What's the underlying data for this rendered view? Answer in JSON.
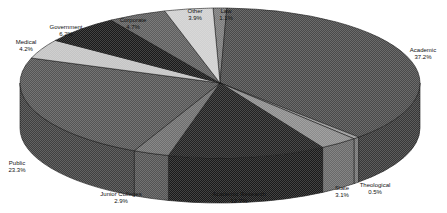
{
  "chart_data": {
    "type": "pie",
    "style": "3d-exploded-none",
    "title": "",
    "units": "%",
    "categories": [
      "Law",
      "Academic",
      "Theological",
      "State",
      "Academic Research",
      "Junior Colleges",
      "Public",
      "Medical",
      "Government",
      "Corporate",
      "Other"
    ],
    "values": [
      1.1,
      37.2,
      0.5,
      3.1,
      12.7,
      2.9,
      23.3,
      4.2,
      6.2,
      4.7,
      3.9
    ],
    "labels": [
      {
        "name": "Law",
        "pct": "1.1%"
      },
      {
        "name": "Academic",
        "pct": "37.2%"
      },
      {
        "name": "Theological",
        "pct": "0.5%"
      },
      {
        "name": "State",
        "pct": "3.1%"
      },
      {
        "name": "Academic Research",
        "pct": "12.7%"
      },
      {
        "name": "Junior Colleges",
        "pct": "2.9%"
      },
      {
        "name": "Public",
        "pct": "23.3%"
      },
      {
        "name": "Medical",
        "pct": "4.2%"
      },
      {
        "name": "Government",
        "pct": "6.2%"
      },
      {
        "name": "Corporate",
        "pct": "4.7%"
      },
      {
        "name": "Other",
        "pct": "3.9%"
      }
    ],
    "colors": [
      "#7a7a7a",
      "#4a4a4a",
      "#9a9a9a",
      "#8c8c8c",
      "#222222",
      "#6e6e6e",
      "#555555",
      "#c4c4c4",
      "#1a1a1a",
      "#5e5e5e",
      "#d0d0d0"
    ],
    "legend": "none (direct labels)",
    "start_angle_deg": -92,
    "direction": "clockwise"
  }
}
